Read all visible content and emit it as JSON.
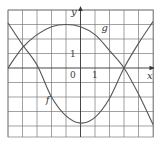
{
  "chart_data": {
    "type": "line",
    "title": "",
    "xlabel": "x",
    "ylabel": "y",
    "xlim": [
      -5,
      5
    ],
    "ylim": [
      -4.8,
      4
    ],
    "grid": true,
    "grid_step": 1,
    "tick_labels": {
      "origin": "0",
      "x_one": "1",
      "y_one": "1"
    },
    "series": [
      {
        "name": "f",
        "x": [
          -5,
          -4,
          -3,
          -2,
          -1,
          0,
          1,
          2,
          3,
          4,
          5
        ],
        "values": [
          3.1,
          1.6,
          0.2,
          -2.0,
          -3.3,
          -3.8,
          -3.4,
          -2.1,
          0,
          1.7,
          3.2
        ],
        "label_pos": [
          -2.4,
          -2.4
        ]
      },
      {
        "name": "g",
        "x": [
          -5,
          -4,
          -3,
          -2,
          -1,
          0,
          1,
          2,
          3,
          4,
          5
        ],
        "values": [
          0,
          1.4,
          2.3,
          2.85,
          3.0,
          2.85,
          2.3,
          1.2,
          0,
          -1.8,
          -3.9
        ],
        "label_pos": [
          1.45,
          2.55
        ]
      }
    ],
    "colors": {
      "grid": "#7a7a7a",
      "axis": "#333333",
      "curve": "#555555",
      "text": "#3a3a3a"
    }
  }
}
